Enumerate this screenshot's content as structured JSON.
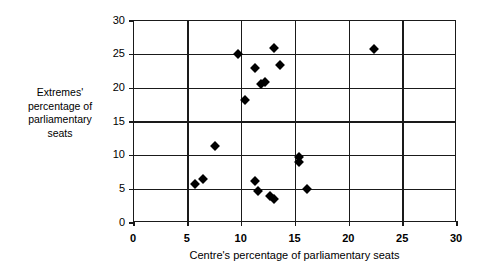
{
  "chart_data": {
    "type": "scatter",
    "title": "",
    "xlabel": "Centre's percentage of parliamentary seats",
    "ylabel": "Extremes' percentage of parliamentary seats",
    "ylabel_lines": [
      "Extremes'",
      "percentage of",
      "parliamentary",
      "seats"
    ],
    "xlim": [
      0,
      30
    ],
    "ylim": [
      0,
      30
    ],
    "xticks": [
      0,
      5,
      10,
      15,
      20,
      25,
      30
    ],
    "yticks": [
      0,
      5,
      10,
      15,
      20,
      25,
      30
    ],
    "xtick_labels": [
      "0",
      "5",
      "10",
      "15",
      "20",
      "25",
      "30"
    ],
    "ytick_labels": [
      "0",
      "5",
      "10",
      "15",
      "20",
      "25",
      "30"
    ],
    "grid": true,
    "legend": "none",
    "marker": "filled-diamond",
    "marker_color": "#000000",
    "points": [
      {
        "x": 5.7,
        "y": 5.8
      },
      {
        "x": 6.4,
        "y": 6.5
      },
      {
        "x": 7.5,
        "y": 11.5
      },
      {
        "x": 9.7,
        "y": 25.1
      },
      {
        "x": 10.3,
        "y": 18.3
      },
      {
        "x": 11.2,
        "y": 23.0
      },
      {
        "x": 11.2,
        "y": 6.3
      },
      {
        "x": 11.5,
        "y": 4.8
      },
      {
        "x": 11.8,
        "y": 20.6
      },
      {
        "x": 12.2,
        "y": 21.0
      },
      {
        "x": 12.6,
        "y": 4.0
      },
      {
        "x": 13.0,
        "y": 26.0
      },
      {
        "x": 13.0,
        "y": 3.6
      },
      {
        "x": 13.6,
        "y": 23.5
      },
      {
        "x": 15.3,
        "y": 9.8
      },
      {
        "x": 15.3,
        "y": 9.0
      },
      {
        "x": 16.1,
        "y": 5.0
      },
      {
        "x": 22.3,
        "y": 25.8
      }
    ]
  }
}
